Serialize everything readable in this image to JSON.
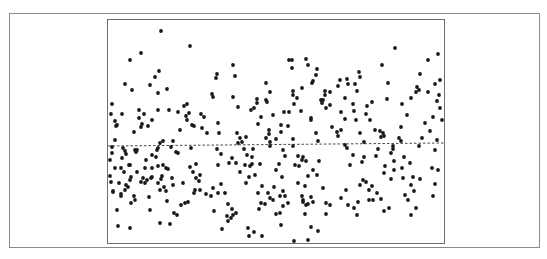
{
  "chart_data": {
    "type": "scatter",
    "title": "",
    "xlabel": "",
    "ylabel": "",
    "grid": false,
    "legend": null,
    "xlim": [
      0,
      336
    ],
    "ylim": [
      0,
      223
    ],
    "reference_line": {
      "style": "dashed",
      "y_start": 97.5,
      "y_end": 100.5,
      "note": "near-horizontal mean/regression line"
    },
    "style": {
      "point_color": "#1a1a1a",
      "line_color": "#333333",
      "frame_color": "#6e6e6e",
      "point_radius": 1.9
    },
    "points_px": [
      [
        161,
        31
      ],
      [
        190,
        46
      ],
      [
        141,
        53
      ],
      [
        130,
        60
      ],
      [
        125,
        84
      ],
      [
        159,
        71
      ],
      [
        155,
        77
      ],
      [
        132,
        90
      ],
      [
        150,
        85
      ],
      [
        139,
        110
      ],
      [
        167,
        89
      ],
      [
        158,
        93
      ],
      [
        169,
        110
      ],
      [
        112,
        104
      ],
      [
        111,
        114
      ],
      [
        122,
        114
      ],
      [
        144,
        114
      ],
      [
        158,
        110
      ],
      [
        115,
        121
      ],
      [
        117,
        125
      ],
      [
        116,
        126
      ],
      [
        139,
        118
      ],
      [
        142,
        124
      ],
      [
        141,
        127
      ],
      [
        134,
        132
      ],
      [
        148,
        126
      ],
      [
        152,
        120
      ],
      [
        110,
        160
      ],
      [
        122,
        158
      ],
      [
        115,
        168
      ],
      [
        124,
        172
      ],
      [
        126,
        185
      ],
      [
        121,
        196
      ],
      [
        117,
        210
      ],
      [
        131,
        203
      ],
      [
        135,
        200
      ],
      [
        134,
        196
      ],
      [
        121,
        194
      ],
      [
        131,
        177
      ],
      [
        129,
        165
      ],
      [
        113,
        192
      ],
      [
        113,
        191
      ],
      [
        118,
        226
      ],
      [
        130,
        228
      ],
      [
        137,
        172
      ],
      [
        143,
        178
      ],
      [
        145,
        168
      ],
      [
        145,
        183
      ],
      [
        151,
        178
      ],
      [
        152,
        168
      ],
      [
        149,
        197
      ],
      [
        150,
        210
      ],
      [
        157,
        150
      ],
      [
        160,
        143
      ],
      [
        152,
        177
      ],
      [
        160,
        190
      ],
      [
        158,
        183
      ],
      [
        163,
        165
      ],
      [
        166,
        168
      ],
      [
        168,
        169
      ],
      [
        172,
        178
      ],
      [
        173,
        185
      ],
      [
        167,
        201
      ],
      [
        170,
        224
      ],
      [
        174,
        213
      ],
      [
        177,
        215
      ],
      [
        160,
        223
      ],
      [
        185,
        203
      ],
      [
        183,
        183
      ],
      [
        176,
        152
      ],
      [
        178,
        153
      ],
      [
        184,
        106
      ],
      [
        187,
        104
      ],
      [
        178,
        112
      ],
      [
        187,
        120
      ],
      [
        189,
        113
      ],
      [
        192,
        125
      ],
      [
        191,
        148
      ],
      [
        190,
        167
      ],
      [
        196,
        164
      ],
      [
        196,
        178
      ],
      [
        200,
        175
      ],
      [
        199,
        181
      ],
      [
        201,
        114
      ],
      [
        204,
        117
      ],
      [
        202,
        128
      ],
      [
        207,
        133
      ],
      [
        212,
        94
      ],
      [
        213,
        97
      ],
      [
        218,
        123
      ],
      [
        219,
        133
      ],
      [
        217,
        149
      ],
      [
        221,
        154
      ],
      [
        218,
        165
      ],
      [
        213,
        188
      ],
      [
        218,
        193
      ],
      [
        221,
        184
      ],
      [
        225,
        193
      ],
      [
        228,
        204
      ],
      [
        227,
        216
      ],
      [
        228,
        221
      ],
      [
        231,
        218
      ],
      [
        232,
        209
      ],
      [
        229,
        163
      ],
      [
        232,
        158
      ],
      [
        236,
        163
      ],
      [
        240,
        172
      ],
      [
        238,
        143
      ],
      [
        240,
        138
      ],
      [
        238,
        107
      ],
      [
        245,
        165
      ],
      [
        246,
        183
      ],
      [
        249,
        177
      ],
      [
        252,
        164
      ],
      [
        258,
        124
      ],
      [
        261,
        117
      ],
      [
        260,
        164
      ],
      [
        262,
        186
      ],
      [
        258,
        193
      ],
      [
        266,
        100
      ],
      [
        267,
        102
      ],
      [
        270,
        92
      ],
      [
        273,
        115
      ],
      [
        269,
        134
      ],
      [
        269,
        130
      ],
      [
        270,
        142
      ],
      [
        276,
        139
      ],
      [
        284,
        112
      ],
      [
        288,
        126
      ],
      [
        293,
        139
      ],
      [
        293,
        146
      ],
      [
        289,
        112
      ],
      [
        293,
        95
      ],
      [
        293,
        91
      ],
      [
        294,
        104
      ],
      [
        297,
        98
      ],
      [
        298,
        156
      ],
      [
        299,
        166
      ],
      [
        302,
        160
      ],
      [
        303,
        157
      ],
      [
        306,
        161
      ],
      [
        308,
        176
      ],
      [
        305,
        186
      ],
      [
        302,
        196
      ],
      [
        303,
        200
      ],
      [
        306,
        205
      ],
      [
        305,
        214
      ],
      [
        311,
        227
      ],
      [
        308,
        240
      ],
      [
        312,
        83
      ],
      [
        313,
        81
      ],
      [
        316,
        75
      ],
      [
        317,
        69
      ],
      [
        325,
        91
      ],
      [
        321,
        100
      ],
      [
        326,
        108
      ],
      [
        332,
        127
      ],
      [
        338,
        136
      ],
      [
        337,
        132
      ],
      [
        338,
        86
      ],
      [
        340,
        80
      ],
      [
        345,
        145
      ],
      [
        347,
        148
      ],
      [
        354,
        111
      ],
      [
        356,
        120
      ],
      [
        353,
        155
      ],
      [
        350,
        165
      ],
      [
        362,
        162
      ],
      [
        364,
        157
      ],
      [
        363,
        180
      ],
      [
        369,
        190
      ],
      [
        369,
        200
      ],
      [
        380,
        131
      ],
      [
        381,
        137
      ],
      [
        383,
        133
      ],
      [
        384,
        136
      ],
      [
        378,
        149
      ],
      [
        376,
        156
      ],
      [
        385,
        166
      ],
      [
        384,
        173
      ],
      [
        391,
        153
      ],
      [
        393,
        146
      ],
      [
        399,
        138
      ],
      [
        401,
        127
      ],
      [
        401,
        141
      ],
      [
        404,
        157
      ],
      [
        402,
        168
      ],
      [
        403,
        178
      ],
      [
        405,
        195
      ],
      [
        408,
        200
      ],
      [
        411,
        215
      ],
      [
        416,
        208
      ],
      [
        411,
        185
      ],
      [
        413,
        177
      ],
      [
        410,
        163
      ],
      [
        419,
        146
      ],
      [
        422,
        138
      ],
      [
        425,
        123
      ],
      [
        430,
        131
      ],
      [
        433,
        117
      ],
      [
        437,
        101
      ],
      [
        437,
        140
      ],
      [
        435,
        150
      ],
      [
        432,
        168
      ],
      [
        438,
        170
      ],
      [
        435,
        184
      ],
      [
        433,
        196
      ],
      [
        414,
        191
      ],
      [
        420,
        179
      ],
      [
        411,
        98
      ],
      [
        402,
        104
      ],
      [
        407,
        115
      ],
      [
        417,
        87
      ],
      [
        419,
        90
      ],
      [
        428,
        92
      ],
      [
        439,
        95
      ],
      [
        440,
        108
      ],
      [
        442,
        120
      ],
      [
        440,
        80
      ],
      [
        435,
        84
      ],
      [
        438,
        54
      ],
      [
        428,
        60
      ],
      [
        420,
        74
      ],
      [
        416,
        92
      ],
      [
        395,
        48
      ],
      [
        382,
        65
      ],
      [
        388,
        83
      ],
      [
        387,
        99
      ],
      [
        372,
        102
      ],
      [
        370,
        120
      ],
      [
        375,
        130
      ],
      [
        364,
        142
      ],
      [
        360,
        133
      ],
      [
        366,
        114
      ],
      [
        367,
        106
      ],
      [
        355,
        84
      ],
      [
        357,
        91
      ],
      [
        360,
        77
      ],
      [
        359,
        72
      ],
      [
        353,
        104
      ],
      [
        348,
        84
      ],
      [
        347,
        79
      ],
      [
        345,
        98
      ],
      [
        341,
        112
      ],
      [
        345,
        119
      ],
      [
        341,
        130
      ],
      [
        330,
        105
      ],
      [
        330,
        92
      ],
      [
        325,
        95
      ],
      [
        322,
        103
      ],
      [
        311,
        118
      ],
      [
        316,
        133
      ],
      [
        318,
        141
      ],
      [
        319,
        161
      ],
      [
        317,
        175
      ],
      [
        313,
        170
      ],
      [
        323,
        188
      ],
      [
        326,
        203
      ],
      [
        330,
        205
      ],
      [
        326,
        214
      ],
      [
        341,
        198
      ],
      [
        346,
        190
      ],
      [
        348,
        205
      ],
      [
        354,
        208
      ],
      [
        357,
        215
      ],
      [
        358,
        202
      ],
      [
        366,
        182
      ],
      [
        372,
        186
      ],
      [
        377,
        193
      ],
      [
        373,
        200
      ],
      [
        381,
        199
      ],
      [
        384,
        211
      ],
      [
        389,
        208
      ],
      [
        391,
        179
      ],
      [
        394,
        170
      ],
      [
        394,
        161
      ],
      [
        393,
        149
      ],
      [
        360,
        185
      ],
      [
        323,
        100
      ],
      [
        311,
        120
      ],
      [
        295,
        165
      ],
      [
        283,
        150
      ],
      [
        285,
        156
      ],
      [
        279,
        164
      ],
      [
        276,
        170
      ],
      [
        282,
        177
      ],
      [
        283,
        191
      ],
      [
        280,
        196
      ],
      [
        273,
        200
      ],
      [
        268,
        193
      ],
      [
        265,
        204
      ],
      [
        255,
        175
      ],
      [
        250,
        166
      ],
      [
        247,
        155
      ],
      [
        244,
        149
      ],
      [
        251,
        110
      ],
      [
        254,
        108
      ],
      [
        257,
        99
      ],
      [
        257,
        103
      ],
      [
        266,
        83
      ],
      [
        281,
        125
      ],
      [
        281,
        132
      ],
      [
        289,
        60
      ],
      [
        292,
        60
      ],
      [
        292,
        68
      ],
      [
        302,
        88
      ],
      [
        308,
        65
      ],
      [
        306,
        59
      ],
      [
        301,
        111
      ],
      [
        266,
        138
      ],
      [
        270,
        146
      ],
      [
        253,
        149
      ],
      [
        252,
        157
      ],
      [
        246,
        137
      ],
      [
        242,
        142
      ],
      [
        237,
        133
      ],
      [
        233,
        97
      ],
      [
        235,
        76
      ],
      [
        233,
        65
      ],
      [
        217,
        74
      ],
      [
        216,
        78
      ],
      [
        194,
        126
      ],
      [
        186,
        116
      ],
      [
        180,
        130
      ],
      [
        173,
        141
      ],
      [
        171,
        147
      ],
      [
        163,
        141
      ],
      [
        158,
        148
      ],
      [
        156,
        157
      ],
      [
        152,
        155
      ],
      [
        146,
        160
      ],
      [
        135,
        150
      ],
      [
        137,
        150
      ],
      [
        136,
        152
      ],
      [
        130,
        180
      ],
      [
        128,
        187
      ],
      [
        125,
        190
      ],
      [
        121,
        168
      ],
      [
        119,
        183
      ],
      [
        110,
        176
      ],
      [
        111,
        182
      ],
      [
        112,
        153
      ],
      [
        112,
        147
      ],
      [
        115,
        140
      ],
      [
        123,
        148
      ],
      [
        125,
        151
      ],
      [
        126,
        154
      ],
      [
        130,
        165
      ],
      [
        141,
        182
      ],
      [
        147,
        180
      ],
      [
        158,
        166
      ],
      [
        162,
        176
      ],
      [
        161,
        179
      ],
      [
        164,
        187
      ],
      [
        166,
        191
      ],
      [
        181,
        205
      ],
      [
        188,
        202
      ],
      [
        194,
        193
      ],
      [
        195,
        190
      ],
      [
        193,
        172
      ],
      [
        200,
        190
      ],
      [
        206,
        194
      ],
      [
        211,
        196
      ],
      [
        214,
        211
      ],
      [
        222,
        229
      ],
      [
        233,
        215
      ],
      [
        236,
        213
      ],
      [
        248,
        228
      ],
      [
        249,
        236
      ],
      [
        254,
        232
      ],
      [
        281,
        225
      ],
      [
        294,
        241
      ],
      [
        318,
        231
      ],
      [
        308,
        204
      ],
      [
        313,
        202
      ],
      [
        311,
        197
      ],
      [
        303,
        202
      ],
      [
        298,
        183
      ],
      [
        288,
        203
      ],
      [
        285,
        196
      ],
      [
        283,
        206
      ],
      [
        274,
        187
      ],
      [
        270,
        198
      ],
      [
        261,
        203
      ],
      [
        259,
        209
      ],
      [
        262,
        236
      ],
      [
        276,
        214
      ],
      [
        280,
        213
      ]
    ]
  }
}
